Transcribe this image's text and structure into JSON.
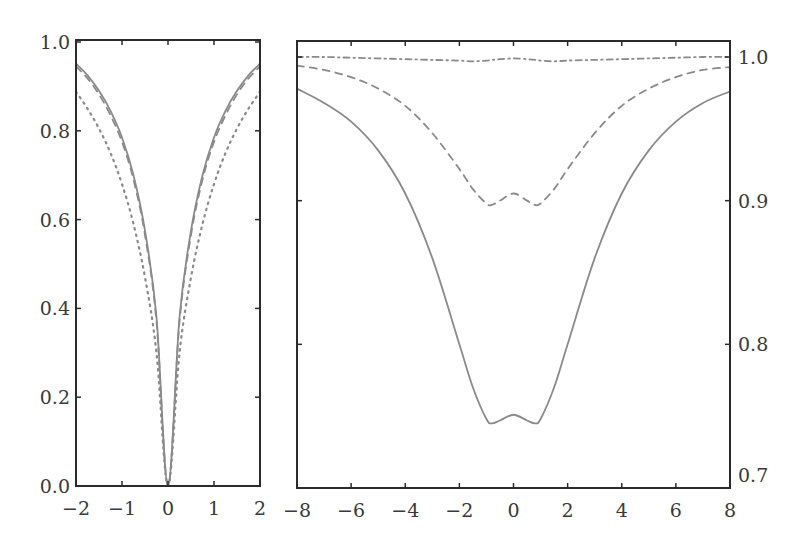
{
  "chart_data": [
    {
      "type": "line",
      "panel": "left",
      "title": "",
      "xlabel": "",
      "ylabel": "",
      "xlim": [
        -2,
        2
      ],
      "ylim": [
        0.0,
        1.0
      ],
      "xticks": [
        "−2",
        "−1",
        "0",
        "1",
        "2"
      ],
      "yticks": [
        "0.0",
        "0.2",
        "0.4",
        "0.6",
        "0.8",
        "1.0"
      ],
      "y_axis_side": "left",
      "grid": false,
      "x": [
        -2,
        -1.75,
        -1.5,
        -1.25,
        -1,
        -0.75,
        -0.5,
        -0.25,
        0,
        0.25,
        0.5,
        0.75,
        1,
        1.25,
        1.5,
        1.75,
        2
      ],
      "series": [
        {
          "name": "solid",
          "style": "solid",
          "values": [
            0.951,
            0.925,
            0.89,
            0.845,
            0.785,
            0.7,
            0.575,
            0.38,
            0.0,
            0.38,
            0.575,
            0.7,
            0.785,
            0.845,
            0.89,
            0.925,
            0.951
          ]
        },
        {
          "name": "dashed",
          "style": "dashed",
          "values": [
            0.945,
            0.918,
            0.882,
            0.835,
            0.775,
            0.69,
            0.565,
            0.37,
            0.0,
            0.37,
            0.565,
            0.69,
            0.775,
            0.835,
            0.882,
            0.918,
            0.945
          ]
        },
        {
          "name": "dotted",
          "style": "dotted",
          "values": [
            0.888,
            0.85,
            0.805,
            0.75,
            0.68,
            0.59,
            0.47,
            0.3,
            0.0,
            0.3,
            0.47,
            0.59,
            0.68,
            0.75,
            0.805,
            0.85,
            0.888
          ]
        }
      ]
    },
    {
      "type": "line",
      "panel": "right",
      "title": "",
      "xlabel": "",
      "ylabel": "",
      "xlim": [
        -8,
        8
      ],
      "ylim": [
        0.7,
        1.0
      ],
      "xticks": [
        "−8",
        "−6",
        "−4",
        "−2",
        "0",
        "2",
        "4",
        "6",
        "8"
      ],
      "yticks": [
        "0.7",
        "0.8",
        "0.9",
        "1.0"
      ],
      "y_axis_side": "right",
      "grid": false,
      "x": [
        -8,
        -7,
        -6,
        -5,
        -4,
        -3,
        -2,
        -1.5,
        -1,
        -0.8,
        -0.5,
        0,
        0.5,
        0.8,
        1,
        1.5,
        2,
        3,
        4,
        5,
        6,
        7,
        8
      ],
      "series": [
        {
          "name": "solid",
          "style": "solid",
          "values": [
            0.978,
            0.968,
            0.955,
            0.935,
            0.905,
            0.86,
            0.8,
            0.77,
            0.748,
            0.745,
            0.747,
            0.751,
            0.747,
            0.745,
            0.748,
            0.77,
            0.8,
            0.86,
            0.905,
            0.935,
            0.955,
            0.968,
            0.976
          ]
        },
        {
          "name": "dashed",
          "style": "dashed",
          "values": [
            0.994,
            0.991,
            0.986,
            0.978,
            0.966,
            0.947,
            0.922,
            0.908,
            0.898,
            0.897,
            0.9,
            0.905,
            0.9,
            0.897,
            0.898,
            0.908,
            0.922,
            0.947,
            0.966,
            0.978,
            0.986,
            0.991,
            0.993
          ]
        },
        {
          "name": "dash-dot",
          "style": "dashdot",
          "values": [
            1.0,
            1.0,
            0.9995,
            0.999,
            0.9985,
            0.998,
            0.9975,
            0.997,
            0.9975,
            0.998,
            0.9985,
            0.999,
            0.9985,
            0.998,
            0.9975,
            0.997,
            0.9975,
            0.998,
            0.9985,
            0.999,
            0.9995,
            1.0,
            1.0
          ]
        }
      ]
    }
  ],
  "colors": {
    "axis": "#2b2b2b",
    "curve": "#8a8a8a",
    "text": "#3a3a3a"
  }
}
